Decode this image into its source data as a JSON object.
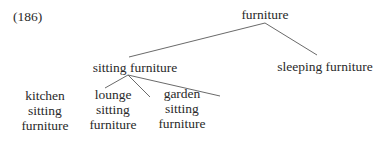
{
  "example_number": "(186)",
  "tree": {
    "root": "furniture",
    "level1": {
      "sitting": "sitting furniture",
      "sleeping": "sleeping furniture"
    },
    "level2": [
      {
        "line1": "kitchen",
        "line2": "sitting",
        "line3": "furniture"
      },
      {
        "line1": "lounge",
        "line2": "sitting",
        "line3": "furniture"
      },
      {
        "line1": "garden",
        "line2": "sitting",
        "line3": "furniture"
      }
    ]
  },
  "colors": {
    "text": "#2a2a2a",
    "edge": "#6a6a6a",
    "background": "#ffffff"
  }
}
